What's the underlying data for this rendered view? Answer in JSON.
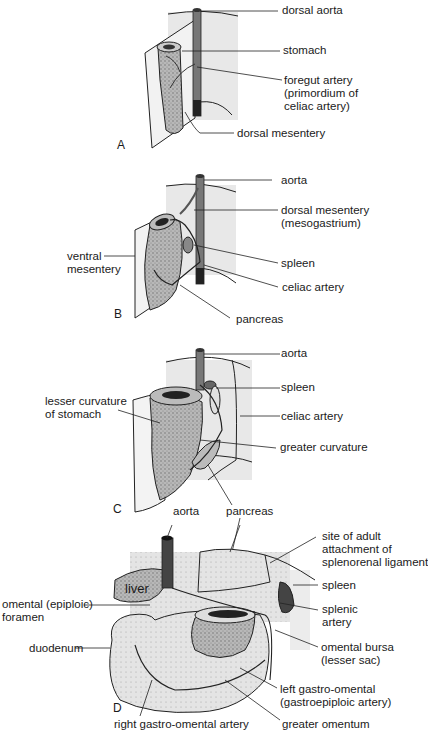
{
  "panels": {
    "A": {
      "letter": "A",
      "labels": {
        "dorsal_aorta": "dorsal aorta",
        "stomach": "stomach",
        "foregut_artery": "foregut artery\n(primordium of\nceliac artery)",
        "dorsal_mesentery": "dorsal mesentery"
      }
    },
    "B": {
      "letter": "B",
      "labels": {
        "aorta": "aorta",
        "dorsal_mesentery": "dorsal mesentery\n(mesogastrium)",
        "ventral_mesentery": "ventral\nmesentery",
        "spleen": "spleen",
        "celiac_artery": "celiac artery",
        "pancreas": "pancreas"
      }
    },
    "C": {
      "letter": "C",
      "labels": {
        "aorta": "aorta",
        "spleen": "spleen",
        "lesser_curvature": "lesser curvature\nof stomach",
        "celiac_artery": "celiac artery",
        "greater_curvature": "greater curvature",
        "pancreas": "pancreas"
      }
    },
    "D": {
      "letter": "D",
      "labels": {
        "aorta": "aorta",
        "site_of_adult_attachment": "site of adult\nattachment of\nsplenorenal ligament",
        "liver": "liver",
        "spleen": "spleen",
        "omental_foramen": "omental (epiploic)\nforamen",
        "splenic_artery": "splenic\nartery",
        "duodenum": "duodenum",
        "omental_bursa": "omental bursa\n(lesser sac)",
        "left_gastro_omental": "left gastro-omental\n(gastroepiploic artery)",
        "right_gastro_omental": "right gastro-omental artery",
        "greater_omentum": "greater omentum"
      }
    }
  },
  "colors": {
    "line": "#1a1a1a",
    "mesentery_shade": "#e6e6e6",
    "organ_shade": "#9a9a9a",
    "organ_dark": "#555555"
  }
}
